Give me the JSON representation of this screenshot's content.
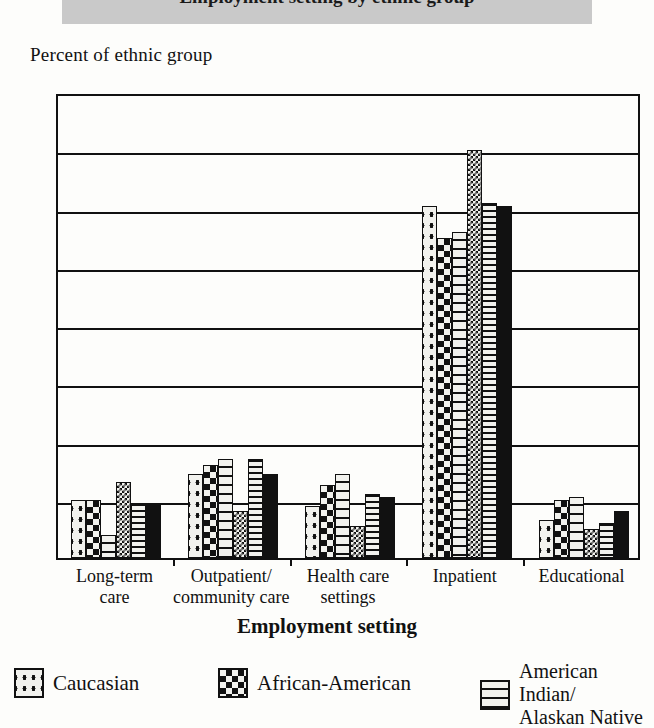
{
  "banner": {
    "title": "Employment setting by ethnic group"
  },
  "axis": {
    "ylabel": "Percent of ethnic group",
    "xlabel": "Employment setting",
    "yticks": [
      "80",
      "70",
      "60",
      "50",
      "40",
      "30",
      "20",
      "10",
      "0"
    ]
  },
  "legend": {
    "items": [
      {
        "label": "Caucasian",
        "pattern": "dots-icon"
      },
      {
        "label": "African-American",
        "pattern": "checkerboard-icon"
      },
      {
        "label": "American Indian/",
        "label2": "Alaskan Native",
        "pattern": "dashes-icon"
      }
    ]
  },
  "chart_data": {
    "type": "bar",
    "title": "Employment setting by ethnic group",
    "xlabel": "Employment setting",
    "ylabel": "Percent of ethnic group",
    "ylim": [
      0,
      80
    ],
    "ytick_step": 10,
    "grid": true,
    "legend_position": "bottom",
    "categories": [
      "Long-term care",
      "Outpatient/ community care",
      "Health care settings",
      "Inpatient",
      "Educational"
    ],
    "category_lines": [
      [
        "Long-term",
        "care"
      ],
      [
        "Outpatient/",
        "community care"
      ],
      [
        "Health care",
        "settings"
      ],
      [
        "Inpatient",
        ""
      ],
      [
        "Educational",
        ""
      ]
    ],
    "series": [
      {
        "name": "Caucasian",
        "pattern": "dots",
        "values": [
          10.0,
          14.5,
          9.0,
          60.5,
          6.5
        ]
      },
      {
        "name": "African-American",
        "pattern": "check",
        "values": [
          10.0,
          16.0,
          12.5,
          55.0,
          10.0
        ]
      },
      {
        "name": "American Indian/Alaskan Native",
        "pattern": "dash",
        "values": [
          4.0,
          17.0,
          14.5,
          56.0,
          10.5
        ]
      },
      {
        "name": "Asian/Pacific Islander",
        "pattern": "finecheck",
        "values": [
          13.0,
          8.0,
          5.5,
          70.0,
          5.0
        ]
      },
      {
        "name": "Hispanic",
        "pattern": "hstripe",
        "values": [
          9.5,
          17.0,
          11.0,
          61.0,
          6.0
        ]
      },
      {
        "name": "Other",
        "pattern": "solid",
        "values": [
          9.5,
          14.5,
          10.5,
          60.5,
          8.0
        ]
      }
    ]
  }
}
